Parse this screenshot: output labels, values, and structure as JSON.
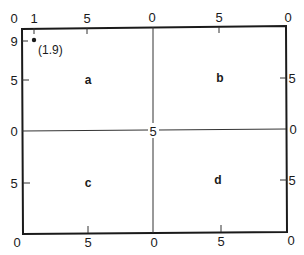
{
  "diagram": {
    "top_ticks": [
      {
        "label": "0",
        "x": 14,
        "y": 18
      },
      {
        "label": "1",
        "x": 34,
        "y": 18
      },
      {
        "label": "5",
        "x": 87,
        "y": 18
      },
      {
        "label": "0",
        "x": 152,
        "y": 17
      },
      {
        "label": "5",
        "x": 219,
        "y": 17
      },
      {
        "label": "0",
        "x": 288,
        "y": 17
      }
    ],
    "left_ticks": [
      {
        "label": "9",
        "x": 14,
        "y": 41
      },
      {
        "label": "5",
        "x": 14,
        "y": 80
      },
      {
        "label": "0",
        "x": 14,
        "y": 131
      },
      {
        "label": "5",
        "x": 14,
        "y": 183
      }
    ],
    "right_ticks": [
      {
        "label": "5",
        "x": 292,
        "y": 78
      },
      {
        "label": "0",
        "x": 293,
        "y": 129
      },
      {
        "label": "5",
        "x": 292,
        "y": 180
      }
    ],
    "bottom_ticks": [
      {
        "label": "0",
        "x": 17,
        "y": 242
      },
      {
        "label": "5",
        "x": 88,
        "y": 242
      },
      {
        "label": "0",
        "x": 154,
        "y": 242
      },
      {
        "label": "5",
        "x": 221,
        "y": 241
      },
      {
        "label": "0",
        "x": 291,
        "y": 240
      }
    ],
    "center_label": "5",
    "quadrants": [
      {
        "label": "a",
        "x": 88,
        "y": 80
      },
      {
        "label": "b",
        "x": 220,
        "y": 78
      },
      {
        "label": "c",
        "x": 88,
        "y": 183
      },
      {
        "label": "d",
        "x": 218,
        "y": 180
      }
    ],
    "point": {
      "label": "(1.9)",
      "x": 34,
      "y": 40
    }
  }
}
